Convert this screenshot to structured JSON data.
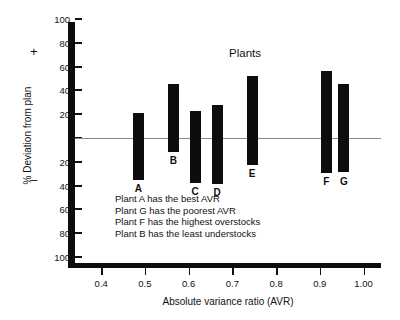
{
  "chart_data": {
    "type": "bar",
    "title": "Plants",
    "xlabel": "Absolute variance ratio  (AVR)",
    "ylabel": "% Deviation from plan",
    "orientation": "vertical-floating",
    "grid": false,
    "legend": null,
    "zero_reference_line": 0,
    "xlim": [
      0.34,
      1.04
    ],
    "ylim": [
      -110,
      110
    ],
    "xticks": [
      0.4,
      0.5,
      0.6,
      0.7,
      0.8,
      0.9,
      1.0
    ],
    "xtick_labels": [
      "0.4",
      "0.5",
      "0.6",
      "0.7",
      "0.8",
      "0.9",
      "1.00"
    ],
    "yticks": [
      100,
      80,
      60,
      40,
      20,
      0,
      -20,
      -40,
      -60,
      -80,
      -100
    ],
    "ytick_labels": [
      "100",
      "80",
      "60",
      "40",
      "20",
      "",
      "20",
      "40",
      "60",
      "80",
      "100"
    ],
    "y_positive_sign": "+",
    "y_negative_sign": "–",
    "categories": [
      "A",
      "B",
      "C",
      "D",
      "E",
      "F",
      "G"
    ],
    "bars": [
      {
        "label": "A",
        "x": 0.485,
        "high": 21,
        "low": -35
      },
      {
        "label": "B",
        "x": 0.565,
        "high": 45,
        "low": -12
      },
      {
        "label": "C",
        "x": 0.615,
        "high": 23,
        "low": -38
      },
      {
        "label": "D",
        "x": 0.665,
        "high": 28,
        "low": -39
      },
      {
        "label": "E",
        "x": 0.745,
        "high": 52,
        "low": -23
      },
      {
        "label": "F",
        "x": 0.915,
        "high": 56,
        "low": -29
      },
      {
        "label": "G",
        "x": 0.955,
        "high": 45,
        "low": -29
      }
    ],
    "annotations": [
      "Plant A has the best AVR",
      "Plant G has the poorest AVR",
      "Plant F has the highest overstocks",
      "Plant B has the least understocks"
    ],
    "colors": {
      "bar": "#0d0d0d",
      "axis": "#0d0d0d",
      "zero_line": "#8a8a8a",
      "text": "#111111",
      "background": "#ffffff"
    }
  }
}
